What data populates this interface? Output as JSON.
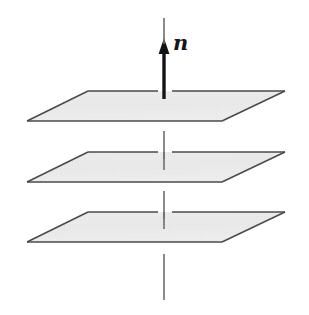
{
  "figure": {
    "background_color": "#ffffff",
    "width": 309,
    "height": 315,
    "labels": {
      "normal_vector": "n"
    },
    "colors": {
      "plane_fill": "#e9e9e9",
      "plane_fill_light": "#f2f2f2",
      "plane_stroke": "#4a4a4a",
      "arrow_color": "#141414",
      "axis_line_color": "#6e6e6e",
      "background": "#ffffff"
    },
    "planes": [
      {
        "name": "top-plane",
        "points": "88,91 285,91 222,121 27,121",
        "gap_x_start": 158,
        "gap_x_end": 172
      },
      {
        "name": "middle-plane",
        "points": "88,152 285,152 222,182 27,182",
        "gap_x_start": 158,
        "gap_x_end": 172
      },
      {
        "name": "bottom-plane",
        "points": "88,212 285,212 222,242 27,242",
        "gap_x_start": 158,
        "gap_x_end": 172
      }
    ],
    "arrow": {
      "name": "normal-vector-arrow",
      "x": 164,
      "tail_y": 98,
      "tip_y": 39,
      "shaft_width": 3.2,
      "head_width": 11,
      "head_length": 15,
      "label_x": 173,
      "label_y": 33
    },
    "axis_segments": [
      {
        "name": "axis-segment-upper-mid",
        "x": 164,
        "y1": 131,
        "y2": 159
      },
      {
        "name": "axis-segment-mid-lower",
        "x": 164,
        "y1": 191,
        "y2": 219
      },
      {
        "name": "axis-segment-below",
        "x": 164,
        "y1": 254,
        "y2": 300
      }
    ]
  }
}
